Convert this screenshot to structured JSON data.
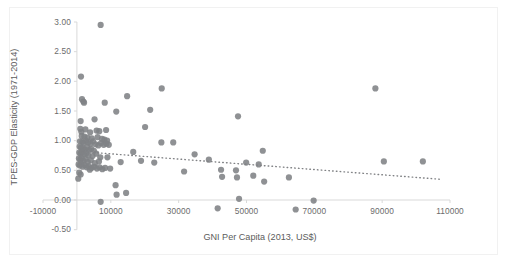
{
  "chart_data": {
    "type": "scatter",
    "title": "",
    "xlabel": "GNI Per Capita (2013, US$)",
    "ylabel": "TPES-GDP Elasticity (1971-2014)",
    "xlim": [
      -10000,
      110000
    ],
    "ylim": [
      -0.5,
      3.0
    ],
    "xticks": [
      -10000,
      10000,
      30000,
      50000,
      70000,
      90000,
      110000
    ],
    "xtick_labels": [
      "-10000",
      "10000",
      "30000",
      "50000",
      "70000",
      "90000",
      "110000"
    ],
    "yticks": [
      -0.5,
      0.0,
      0.5,
      1.0,
      1.5,
      2.0,
      2.5,
      3.0
    ],
    "ytick_labels": [
      "-0.50",
      "0.00",
      "0.50",
      "1.00",
      "1.50",
      "2.00",
      "2.50",
      "3.00"
    ],
    "grid": false,
    "legend": "none",
    "marker_color": "#808285",
    "marker_size": 3.1,
    "axis_color": "#d9d9d9",
    "label_color": "#6b6b6b",
    "trendline": {
      "style": "dotted",
      "color": "#808285",
      "x_start": 5000,
      "y_start": 0.8,
      "x_end": 107000,
      "y_end": 0.35
    },
    "series": [
      {
        "name": "Countries",
        "points": [
          [
            7000,
            2.95
          ],
          [
            1200,
            2.08
          ],
          [
            1500,
            1.7
          ],
          [
            1900,
            1.66
          ],
          [
            2100,
            1.64
          ],
          [
            1100,
            1.33
          ],
          [
            5200,
            1.36
          ],
          [
            8200,
            1.64
          ],
          [
            14800,
            1.75
          ],
          [
            11600,
            1.49
          ],
          [
            25000,
            1.88
          ],
          [
            88000,
            1.88
          ],
          [
            21600,
            1.52
          ],
          [
            20100,
            1.23
          ],
          [
            47500,
            1.41
          ],
          [
            1000,
            1.2
          ],
          [
            1300,
            1.15
          ],
          [
            2500,
            1.19
          ],
          [
            3900,
            1.14
          ],
          [
            5800,
            1.17
          ],
          [
            6600,
            1.16
          ],
          [
            8600,
            1.18
          ],
          [
            1400,
            1.08
          ],
          [
            2200,
            1.07
          ],
          [
            3100,
            1.05
          ],
          [
            4400,
            1.04
          ],
          [
            6100,
            1.06
          ],
          [
            7400,
            1.03
          ],
          [
            8100,
            1.02
          ],
          [
            8900,
            1.0
          ],
          [
            900,
            0.99
          ],
          [
            1600,
            0.98
          ],
          [
            2000,
            0.96
          ],
          [
            2700,
            1.0
          ],
          [
            3300,
            0.97
          ],
          [
            4000,
            0.95
          ],
          [
            4800,
            0.99
          ],
          [
            5500,
            0.94
          ],
          [
            6300,
            0.92
          ],
          [
            7100,
            0.96
          ],
          [
            7900,
            0.93
          ],
          [
            8700,
            0.95
          ],
          [
            9400,
            0.93
          ],
          [
            800,
            0.9
          ],
          [
            1200,
            0.88
          ],
          [
            1800,
            0.87
          ],
          [
            2400,
            0.85
          ],
          [
            3000,
            0.89
          ],
          [
            3600,
            0.84
          ],
          [
            4200,
            0.86
          ],
          [
            5000,
            0.83
          ],
          [
            700,
            0.8
          ],
          [
            1100,
            0.78
          ],
          [
            1500,
            0.81
          ],
          [
            2100,
            0.77
          ],
          [
            2800,
            0.79
          ],
          [
            3400,
            0.75
          ],
          [
            4600,
            0.74
          ],
          [
            5700,
            0.78
          ],
          [
            6900,
            0.72
          ],
          [
            600,
            0.7
          ],
          [
            1000,
            0.68
          ],
          [
            1400,
            0.71
          ],
          [
            1900,
            0.66
          ],
          [
            2600,
            0.69
          ],
          [
            3200,
            0.64
          ],
          [
            4100,
            0.67
          ],
          [
            5300,
            0.62
          ],
          [
            6500,
            0.65
          ],
          [
            9000,
            0.72
          ],
          [
            500,
            0.6
          ],
          [
            900,
            0.58
          ],
          [
            1300,
            0.61
          ],
          [
            1700,
            0.56
          ],
          [
            2300,
            0.59
          ],
          [
            2900,
            0.55
          ],
          [
            3500,
            0.57
          ],
          [
            4300,
            0.54
          ],
          [
            5100,
            0.56
          ],
          [
            5900,
            0.53
          ],
          [
            6700,
            0.55
          ],
          [
            7500,
            0.52
          ],
          [
            8300,
            0.54
          ],
          [
            9800,
            0.53
          ],
          [
            700,
            0.46
          ],
          [
            1100,
            0.43
          ],
          [
            3800,
            0.51
          ],
          [
            400,
            0.36
          ],
          [
            11400,
            0.25
          ],
          [
            11700,
            0.09
          ],
          [
            14500,
            0.12
          ],
          [
            12900,
            0.64
          ],
          [
            16600,
            0.81
          ],
          [
            18900,
            0.66
          ],
          [
            22800,
            0.63
          ],
          [
            24900,
            0.97
          ],
          [
            28400,
            0.97
          ],
          [
            31600,
            0.48
          ],
          [
            34700,
            0.77
          ],
          [
            38900,
            0.68
          ],
          [
            42500,
            0.51
          ],
          [
            42800,
            0.39
          ],
          [
            46900,
            0.5
          ],
          [
            47200,
            0.38
          ],
          [
            49900,
            0.63
          ],
          [
            52000,
            0.41
          ],
          [
            53600,
            0.6
          ],
          [
            54800,
            0.83
          ],
          [
            55200,
            0.31
          ],
          [
            62500,
            0.38
          ],
          [
            90500,
            0.65
          ],
          [
            102000,
            0.65
          ],
          [
            7000,
            -0.03
          ],
          [
            47800,
            0.02
          ],
          [
            69800,
            -0.01
          ],
          [
            41500,
            -0.14
          ],
          [
            64500,
            -0.16
          ]
        ]
      }
    ]
  }
}
